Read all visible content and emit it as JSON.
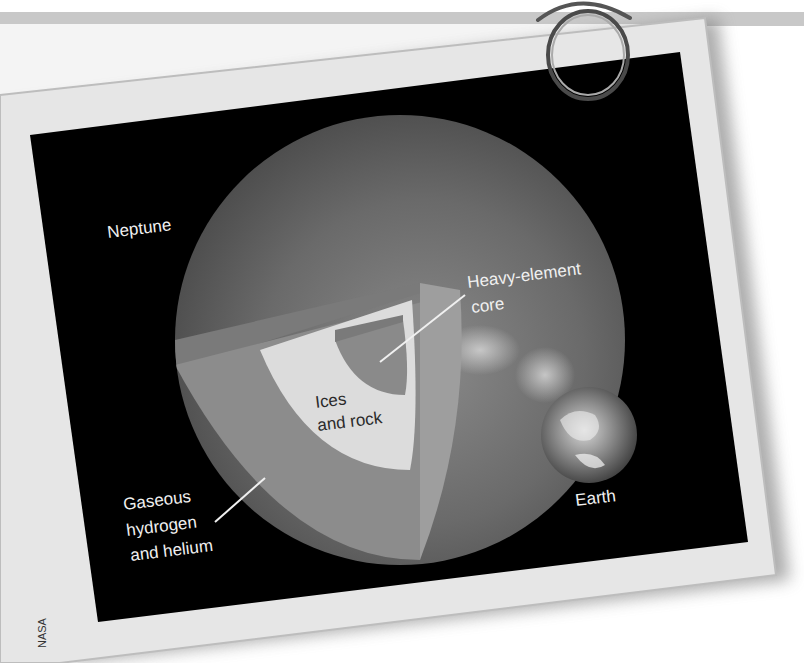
{
  "figure": {
    "labels": {
      "planet": "Neptune",
      "core_line1": "Heavy-element",
      "core_line2": "core",
      "mantle_line1": "Ices",
      "mantle_line2": "and rock",
      "envelope_line1": "Gaseous",
      "envelope_line2": "hydrogen",
      "envelope_line3": "and helium",
      "comparison": "Earth"
    },
    "credit": "NASA"
  },
  "colors": {
    "background": "#ffffff",
    "stamp_border": "#e6e6e6",
    "photo_bg": "#000000",
    "neptune_surface": "#5a5a5a",
    "envelope": "#8c8c8c",
    "envelope_side": "#9a9a9a",
    "mantle": "#dcdcdc",
    "core": "#8a8a8a",
    "label_light": "#f0f0f0",
    "label_dark": "#2a2a2a"
  }
}
